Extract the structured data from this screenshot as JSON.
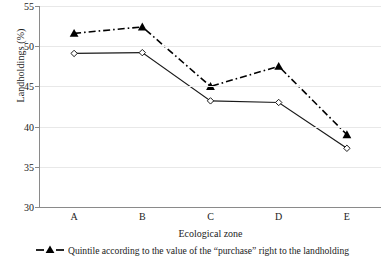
{
  "chart_data": {
    "type": "line",
    "title": "",
    "xlabel": "Ecological zone",
    "ylabel": "Landholdings (%)",
    "categories": [
      "A",
      "B",
      "C",
      "D",
      "E"
    ],
    "ylim": [
      30,
      55
    ],
    "yticks": [
      30,
      35,
      40,
      45,
      50,
      55
    ],
    "ytick_labels": [
      "30",
      "35",
      "40",
      "45",
      "50",
      "55"
    ],
    "grid": true,
    "legend_position": "below",
    "series": [
      {
        "name": "Quintile according to the value of the “purchase” right to the landholding",
        "marker": "filled-triangle",
        "line_style": "dash-dot",
        "color": "#000000",
        "values": [
          51.6,
          52.4,
          45.0,
          47.5,
          39.0
        ]
      },
      {
        "name": "",
        "marker": "open-diamond",
        "line_style": "solid",
        "color": "#1a1a1a",
        "values": [
          49.1,
          49.2,
          43.2,
          43.0,
          37.3
        ]
      }
    ]
  },
  "axes": {
    "y_title": "Landholdings (%)",
    "x_title": "Ecological zone"
  },
  "legend": {
    "items": [
      {
        "label": "Quintile according to the value of the “purchase” right to the landholding"
      }
    ]
  }
}
